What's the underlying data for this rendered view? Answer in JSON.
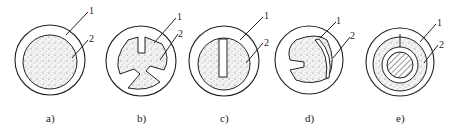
{
  "figure": {
    "panels": [
      {
        "id": "a",
        "caption": "a)",
        "callouts": [
          "1",
          "2"
        ]
      },
      {
        "id": "b",
        "caption": "b)",
        "callouts": [
          "1",
          "2"
        ]
      },
      {
        "id": "c",
        "caption": "c)",
        "callouts": [
          "1",
          "2"
        ]
      },
      {
        "id": "d",
        "caption": "d)",
        "callouts": [
          "1",
          "2"
        ]
      },
      {
        "id": "e",
        "caption": "e)",
        "callouts": [
          "1",
          "2"
        ]
      }
    ],
    "legend_note": "1 = outer sheath/shell, 2 = stippled filler core",
    "colors": {
      "line": "#222222",
      "background": "#ffffff",
      "stipple": "#555555",
      "hatch": "#333333"
    }
  }
}
